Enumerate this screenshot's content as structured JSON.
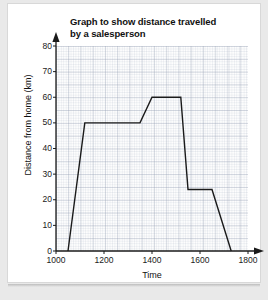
{
  "chart_data": {
    "type": "line",
    "title": "Graph to show distance travelled by a salesperson",
    "title_line1": "Graph to show distance travelled",
    "title_line2": "by a salesperson",
    "xlabel": "Time",
    "ylabel": "Distance from home (km)",
    "xlim": [
      1000,
      1800
    ],
    "ylim": [
      0,
      80
    ],
    "xticks": [
      1000,
      1200,
      1400,
      1600,
      1800
    ],
    "yticks": [
      0,
      10,
      20,
      30,
      40,
      50,
      60,
      70,
      80
    ],
    "xtick_labels": [
      "1000",
      "1200",
      "1400",
      "1600",
      "1800"
    ],
    "ytick_labels": [
      "0",
      "10",
      "20",
      "30",
      "40",
      "50",
      "60",
      "70",
      "80"
    ],
    "x_minor_step": 40,
    "y_minor_step": 2,
    "grid": true,
    "grid_color": "#aab4c8",
    "legend": null,
    "line_color": "#1a1a1a",
    "line_width": 1.4,
    "series": [
      {
        "name": "Distance from home",
        "points": [
          {
            "x": 1050,
            "y": 0
          },
          {
            "x": 1120,
            "y": 50
          },
          {
            "x": 1350,
            "y": 50
          },
          {
            "x": 1400,
            "y": 60
          },
          {
            "x": 1520,
            "y": 60
          },
          {
            "x": 1550,
            "y": 24
          },
          {
            "x": 1650,
            "y": 24
          },
          {
            "x": 1730,
            "y": 0
          }
        ],
        "x": [
          1050,
          1120,
          1350,
          1400,
          1520,
          1550,
          1650,
          1730
        ],
        "values": [
          0,
          50,
          50,
          60,
          60,
          24,
          24,
          0
        ]
      }
    ]
  }
}
